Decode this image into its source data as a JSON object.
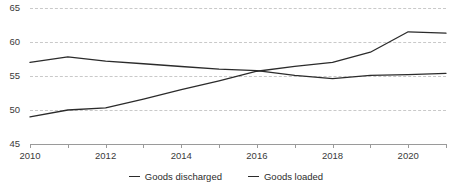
{
  "chart_data": {
    "type": "line",
    "title": "",
    "subtitle": "",
    "xlabel": "",
    "ylabel": "",
    "x": [
      2010,
      2011,
      2012,
      2013,
      2014,
      2015,
      2016,
      2017,
      2018,
      2019,
      2020,
      2021
    ],
    "xlim": [
      2010,
      2021
    ],
    "ylim": [
      45,
      65
    ],
    "yticks": [
      45,
      50,
      55,
      60,
      65
    ],
    "xticks": [
      2010,
      2011,
      2012,
      2013,
      2014,
      2015,
      2016,
      2017,
      2018,
      2019,
      2020,
      2021
    ],
    "xtick_labels_shown": [
      2010,
      2012,
      2014,
      2016,
      2018,
      2020
    ],
    "grid": true,
    "grid_axis": "y",
    "legend_position": "bottom",
    "series": [
      {
        "name": "Goods discharged",
        "color": "#2b2b2b",
        "values": [
          49.0,
          50.0,
          50.3,
          51.6,
          53.0,
          54.3,
          55.7,
          56.4,
          57.0,
          58.5,
          61.5,
          61.3
        ]
      },
      {
        "name": "Goods loaded",
        "color": "#2b2b2b",
        "values": [
          57.0,
          57.8,
          57.2,
          56.8,
          56.4,
          56.0,
          55.8,
          55.1,
          54.6,
          55.1,
          55.2,
          55.4
        ]
      }
    ]
  },
  "axis": {
    "ytick_labels": [
      "45",
      "50",
      "55",
      "60",
      "65"
    ],
    "xtick_labels": [
      "2010",
      "2012",
      "2014",
      "2016",
      "2018",
      "2020"
    ]
  },
  "legend": {
    "items": [
      {
        "label": "Goods discharged"
      },
      {
        "label": "Goods loaded"
      }
    ]
  }
}
